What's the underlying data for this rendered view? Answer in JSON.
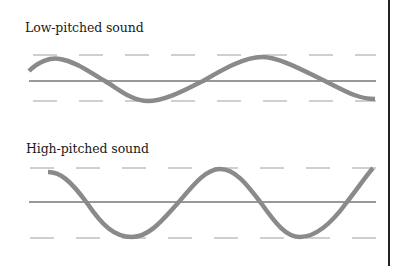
{
  "panels": [
    {
      "title": "Low-pitched sound",
      "description": "Sine wave with long wavelength (about 1.65 cycles shown)",
      "upper_guide_y": 55,
      "lower_guide_y": 101,
      "center_line_y": 81
    },
    {
      "title": "High-pitched sound",
      "description": "Sine wave with short wavelength (about 2.6 cycles shown)",
      "upper_guide_y": 168,
      "lower_guide_y": 238,
      "center_line_y": 202
    }
  ],
  "colors": {
    "wave": "#8a8a8a",
    "axis_line": "#333333",
    "guide_dash": "#a0a0a0",
    "border": "#222222",
    "text": "#1a1a1a"
  }
}
